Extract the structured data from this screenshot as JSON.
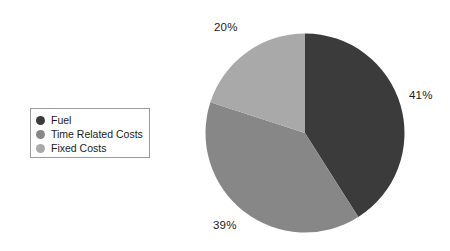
{
  "chart_data": {
    "type": "pie",
    "title": "",
    "categories": [
      "Fuel",
      "Time Related Costs",
      "Fixed Costs"
    ],
    "values": [
      41,
      39,
      20
    ],
    "value_labels": [
      "41%",
      "39%",
      "20%"
    ],
    "units": "percent",
    "colors": [
      "#3b3b3b",
      "#878787",
      "#a9a9a9"
    ],
    "legend_position": "left",
    "grid": false,
    "start_angle_deg": 0,
    "direction": "clockwise",
    "slices": [
      {
        "label": "Fuel",
        "value": 41,
        "display": "41%",
        "color": "#3b3b3b"
      },
      {
        "label": "Time Related Costs",
        "value": 39,
        "display": "39%",
        "color": "#878787"
      },
      {
        "label": "Fixed Costs",
        "value": 20,
        "display": "20%",
        "color": "#a9a9a9"
      }
    ]
  },
  "legend": {
    "items": [
      {
        "label": "Fuel",
        "color": "#3b3b3b"
      },
      {
        "label": "Time Related Costs",
        "color": "#878787"
      },
      {
        "label": "Fixed Costs",
        "color": "#a9a9a9"
      }
    ]
  },
  "labels": {
    "fuel_pct": "41%",
    "time_pct": "39%",
    "fixed_pct": "20%"
  },
  "colors": {
    "background": "#ffffff",
    "text": "#1b1b1b",
    "legend_border": "#9a9a9a"
  }
}
